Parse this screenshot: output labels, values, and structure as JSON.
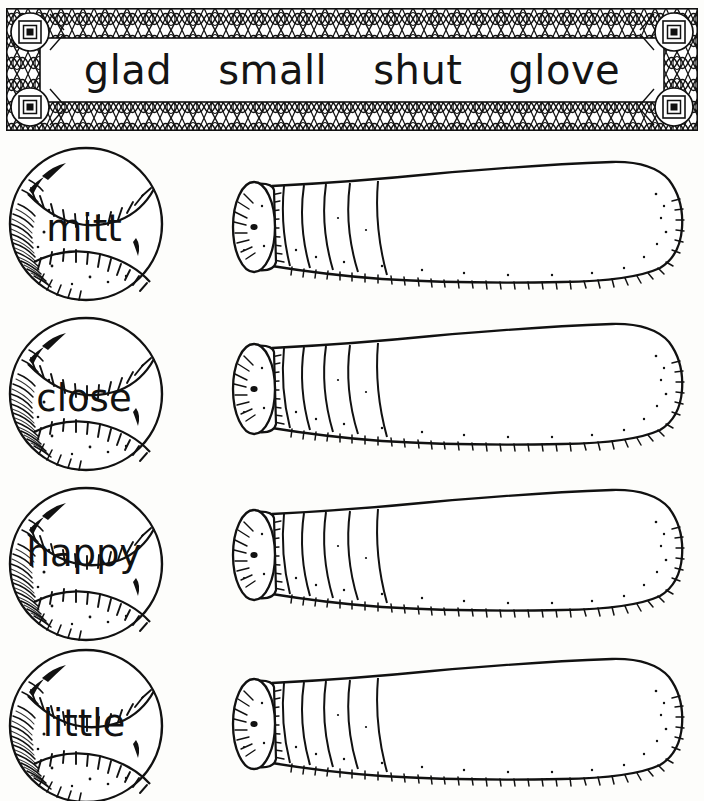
{
  "worksheet": {
    "title": "Baseball word match worksheet",
    "background_color": "#fdfdfb",
    "ink_color": "#111111"
  },
  "word_bank": {
    "name": "word-bank",
    "border_style": "decorative-lattice-frame",
    "words": [
      {
        "text": "glad"
      },
      {
        "text": "small"
      },
      {
        "text": "shut"
      },
      {
        "text": "glove"
      }
    ]
  },
  "rows": [
    {
      "ball": {
        "word": "mitt",
        "shape": "baseball"
      },
      "bat": {
        "shape": "baseball-bat",
        "orientation": "knob-left-barrel-right"
      }
    },
    {
      "ball": {
        "word": "close",
        "shape": "baseball"
      },
      "bat": {
        "shape": "baseball-bat",
        "orientation": "knob-left-barrel-right"
      }
    },
    {
      "ball": {
        "word": "happy",
        "shape": "baseball"
      },
      "bat": {
        "shape": "baseball-bat",
        "orientation": "knob-left-barrel-right"
      }
    },
    {
      "ball": {
        "word": "little",
        "shape": "baseball"
      },
      "bat": {
        "shape": "baseball-bat",
        "orientation": "knob-left-barrel-right"
      }
    }
  ]
}
